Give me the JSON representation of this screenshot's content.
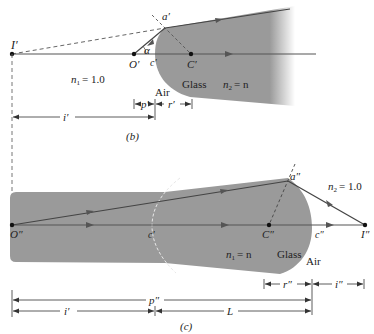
{
  "colors": {
    "glass": "#9a9a9a",
    "ray": "#444444",
    "axis": "#555555",
    "dashed": "#666666",
    "dimension": "#333333",
    "background": "#ffffff"
  },
  "panel_b": {
    "caption": "(b)",
    "points": {
      "image": "I′",
      "object": "O′",
      "vertex": "c′",
      "center": "C′",
      "refraction_point": "a′"
    },
    "angle_label": "α",
    "medium_left": {
      "name": "Air",
      "index_label": "n",
      "index_sub": "1",
      "index_value": "= 1.0"
    },
    "medium_right": {
      "name": "Glass",
      "index_label": "n",
      "index_sub": "2",
      "index_value": "= n"
    },
    "dimensions": {
      "object_distance": "p′",
      "radius": "r′",
      "image_distance": "i′"
    }
  },
  "panel_c": {
    "caption": "(c)",
    "points": {
      "object": "O″",
      "left_vertex": "c′",
      "center": "C″",
      "right_vertex": "c″",
      "image": "I″",
      "refraction_point": "a″"
    },
    "medium_left": {
      "name": "Glass",
      "index_label": "n",
      "index_sub": "1",
      "index_value": "= n"
    },
    "medium_right": {
      "name": "Air",
      "index_label": "n",
      "index_sub": "2",
      "index_value": "= 1.0"
    },
    "dimensions": {
      "object_distance": "p″",
      "first_image_distance": "i′",
      "length": "L",
      "radius": "r″",
      "image_distance": "i″"
    }
  }
}
